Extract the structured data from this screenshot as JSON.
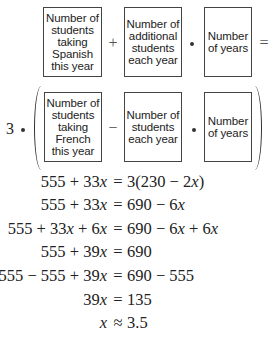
{
  "verbal_model": {
    "row1": {
      "box1": "Number of\nstudents\ntaking\nSpanish\nthis year",
      "op1": "+",
      "box2": "Number of\nadditional\nstudents\neach year",
      "op2": "•",
      "box3": "Number\nof years",
      "equals": "="
    },
    "row2": {
      "coefficient": "3",
      "op0": "•",
      "box1": "Number of\nstudents\ntaking\nFrench\nthis year",
      "op1": "−",
      "box2": "Number of\nstudents\neach year",
      "op2": "•",
      "box3": "Number\nof years"
    }
  },
  "equations": [
    {
      "lhs": "555 + 33x",
      "rel": "=",
      "rhs": "3(230 − 2x)"
    },
    {
      "lhs": "555 + 33x",
      "rel": "=",
      "rhs": "690 − 6x"
    },
    {
      "lhs": "555 + 33x + 6x",
      "rel": "=",
      "rhs": "690 − 6x + 6x"
    },
    {
      "lhs": "555 + 39x",
      "rel": "=",
      "rhs": "690"
    },
    {
      "lhs": "555 − 555 + 39x",
      "rel": "=",
      "rhs": "690 − 555"
    },
    {
      "lhs": "39x",
      "rel": "=",
      "rhs": "135"
    },
    {
      "lhs": "x",
      "rel": "≈",
      "rhs": "3.5"
    }
  ]
}
